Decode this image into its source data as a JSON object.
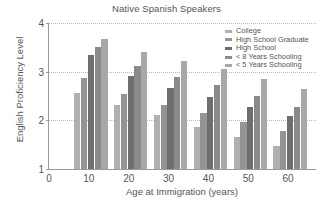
{
  "chart_data": {
    "type": "bar",
    "title": "Native Spanish Speakers",
    "xlabel": "Age at Immigration (years)",
    "ylabel": "English Proficiency Level",
    "categories": [
      "10",
      "20",
      "30",
      "40",
      "50",
      "60"
    ],
    "xtick_labels": [
      "0",
      "10",
      "20",
      "30",
      "40",
      "50",
      "60"
    ],
    "ytick_labels": [
      "1",
      "2",
      "3",
      "4"
    ],
    "ylim": [
      1,
      4
    ],
    "xlim": [
      0,
      67
    ],
    "grid": "horizontal-dotted",
    "legend_position": "top-right-inside",
    "series": [
      {
        "name": "College",
        "color": "#b0b0b0",
        "values": [
          2.57,
          2.32,
          2.1,
          1.87,
          1.65,
          1.48
        ]
      },
      {
        "name": "High School Graduate",
        "color": "#949494",
        "values": [
          2.86,
          2.54,
          2.32,
          2.15,
          1.97,
          1.78
        ]
      },
      {
        "name": "High School",
        "color": "#6e6e6e",
        "values": [
          3.34,
          2.91,
          2.67,
          2.48,
          2.27,
          2.08
        ]
      },
      {
        "name": "< 8 Years Schooling",
        "color": "#8a8a8a",
        "values": [
          3.5,
          3.11,
          2.9,
          2.72,
          2.5,
          2.28
        ]
      },
      {
        "name": "< 5 Years Schooling",
        "color": "#a8a8a8",
        "values": [
          3.67,
          3.4,
          3.21,
          3.05,
          2.84,
          2.65
        ]
      }
    ]
  }
}
